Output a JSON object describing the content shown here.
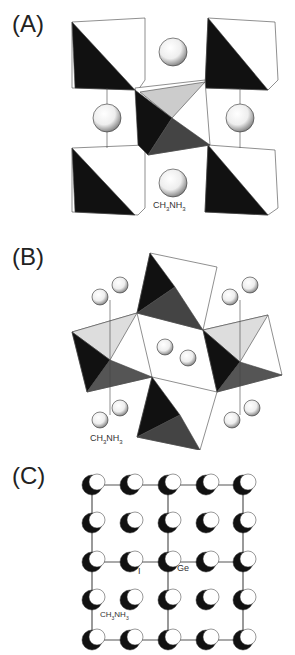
{
  "figure": {
    "panels": [
      {
        "label": "(A)",
        "annotations": [
          "CH3NH3"
        ],
        "subscripts": {
          "ch3nh3": [
            "CH",
            "3",
            "NH",
            "3"
          ]
        }
      },
      {
        "label": "(B)",
        "annotations": [
          "CH3NH3"
        ]
      },
      {
        "label": "(C)",
        "annotations": [
          "CH3NH3",
          "I",
          "Ge"
        ]
      }
    ],
    "labels": {
      "a": "(A)",
      "b": "(B)",
      "c": "(C)",
      "ch": "CH",
      "sub3": "3",
      "nh": "NH",
      "iodine": "I",
      "germanium": "Ge"
    }
  }
}
